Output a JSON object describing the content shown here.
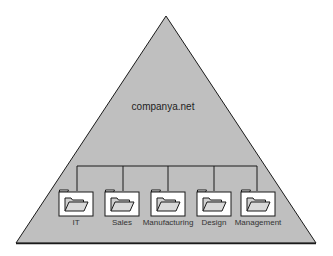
{
  "domain": {
    "name": "companya.net",
    "shape": "triangle",
    "fill_color": "#bfbfbf",
    "stroke_color": "#1a1a1a"
  },
  "connector": {
    "stroke_color": "#1a1a1a"
  },
  "organizational_units": [
    {
      "label": "IT",
      "icon": "folder-open-icon"
    },
    {
      "label": "Sales",
      "icon": "folder-open-icon"
    },
    {
      "label": "Manufacturing",
      "icon": "folder-open-icon"
    },
    {
      "label": "Design",
      "icon": "folder-open-icon"
    },
    {
      "label": "Management",
      "icon": "folder-open-icon"
    }
  ]
}
